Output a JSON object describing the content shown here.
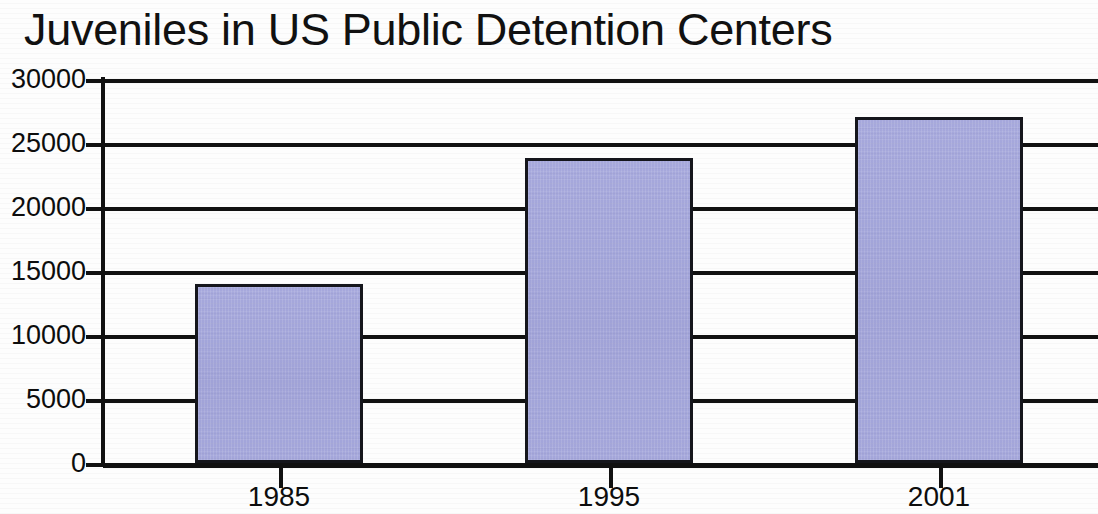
{
  "chart_data": {
    "type": "bar",
    "title": "Juveniles in US Public Detention Centers",
    "xlabel": "",
    "ylabel": "",
    "categories": [
      "1985",
      "1995",
      "2001"
    ],
    "values": [
      14000,
      23800,
      27000
    ],
    "series": [
      {
        "name": "Juveniles in custody",
        "values": [
          14000,
          23800,
          27000
        ]
      }
    ],
    "ylim": [
      0,
      30000
    ],
    "ytick_labels": [
      "30000",
      "25000",
      "20000",
      "15000",
      "10000",
      "5000",
      "0"
    ],
    "ytick_values": [
      30000,
      25000,
      20000,
      15000,
      10000,
      5000,
      0
    ],
    "grid": true,
    "grid_axis": "y",
    "legend": false,
    "legend_position": "none",
    "bar_fill_color": "#a2a5da",
    "bar_border_color": "#15161c",
    "axis_color": "#111111",
    "background_color": "#ffffff",
    "text_color": "#0d0d0d"
  }
}
